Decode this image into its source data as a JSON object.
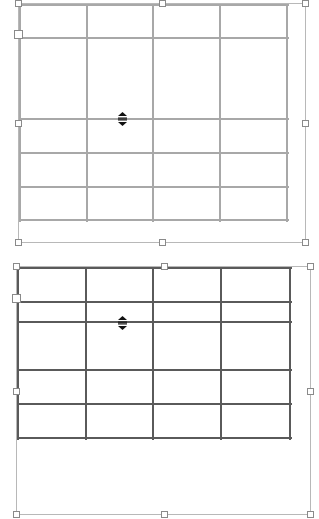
{
  "canvas": {
    "width": 319,
    "height": 519,
    "background": "#ffffff"
  },
  "tables": [
    {
      "id": "top-table",
      "state": "light",
      "line_color": "#a8a8a8",
      "rows": 5,
      "cols": 4,
      "x_lines": [
        20,
        87,
        153,
        220,
        287
      ],
      "y_lines": [
        5,
        38,
        119,
        153,
        187,
        220
      ],
      "frame": {
        "x": 18,
        "y": 3,
        "w": 288,
        "h": 240
      },
      "cursor": {
        "icon": "row-resize-icon",
        "x": 118,
        "y": 112
      }
    },
    {
      "id": "bottom-table",
      "state": "dark",
      "line_color": "#5a5a5a",
      "rows": 6,
      "cols": 4,
      "x_lines": [
        18,
        86,
        153,
        221,
        290
      ],
      "y_lines": [
        268,
        302,
        322,
        370,
        404,
        438
      ],
      "frame": {
        "x": 16,
        "y": 266,
        "w": 295,
        "h": 249
      },
      "cursor": {
        "icon": "row-resize-icon",
        "x": 118,
        "y": 316
      }
    }
  ]
}
